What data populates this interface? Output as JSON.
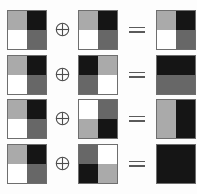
{
  "figure": {
    "caption": "",
    "operator_symbol": "circled-plus",
    "equals_symbol": "=",
    "palette": {
      "white": "#ffffff",
      "light_gray": "#aaaaaa",
      "dark_gray": "#676767",
      "black": "#151515",
      "border": "#6e6e6e"
    },
    "shade_names": [
      "white",
      "light_gray",
      "dark_gray",
      "black"
    ],
    "rows": [
      {
        "index": 1,
        "operand_a": {
          "label": "tile-a-1",
          "cells": [
            "light_gray",
            "black",
            "white",
            "dark_gray"
          ]
        },
        "operand_b": {
          "label": "tile-b-1",
          "cells": [
            "light_gray",
            "black",
            "white",
            "dark_gray"
          ]
        },
        "result": {
          "label": "tile-result-1",
          "cells": [
            "light_gray",
            "black",
            "white",
            "dark_gray"
          ]
        }
      },
      {
        "index": 2,
        "operand_a": {
          "label": "tile-a-2",
          "cells": [
            "light_gray",
            "black",
            "white",
            "dark_gray"
          ]
        },
        "operand_b": {
          "label": "tile-b-2",
          "cells": [
            "black",
            "light_gray",
            "dark_gray",
            "white"
          ]
        },
        "result": {
          "label": "tile-result-2",
          "cells": [
            "black",
            "black",
            "dark_gray",
            "dark_gray"
          ]
        }
      },
      {
        "index": 3,
        "operand_a": {
          "label": "tile-a-3",
          "cells": [
            "light_gray",
            "black",
            "white",
            "dark_gray"
          ]
        },
        "operand_b": {
          "label": "tile-b-3",
          "cells": [
            "white",
            "dark_gray",
            "light_gray",
            "black"
          ]
        },
        "result": {
          "label": "tile-result-3",
          "cells": [
            "light_gray",
            "black",
            "light_gray",
            "black"
          ]
        }
      },
      {
        "index": 4,
        "operand_a": {
          "label": "tile-a-4",
          "cells": [
            "light_gray",
            "black",
            "white",
            "dark_gray"
          ]
        },
        "operand_b": {
          "label": "tile-b-4",
          "cells": [
            "dark_gray",
            "white",
            "black",
            "light_gray"
          ]
        },
        "result": {
          "label": "tile-result-4",
          "cells": [
            "black",
            "black",
            "black",
            "black"
          ]
        }
      }
    ]
  }
}
